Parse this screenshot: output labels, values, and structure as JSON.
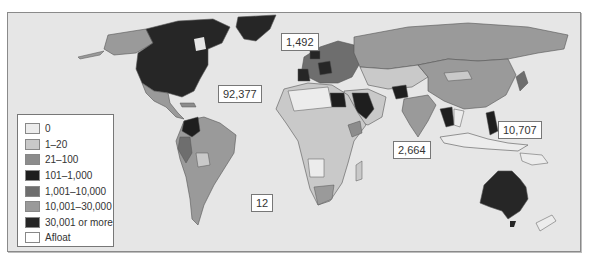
{
  "map": {
    "type": "choropleth-world",
    "background_color": "#e6e6e6",
    "callouts": [
      {
        "label": "1,492",
        "region": "greenland-north-atlantic"
      },
      {
        "label": "92,377",
        "region": "north-america"
      },
      {
        "label": "2,664",
        "region": "indian-ocean"
      },
      {
        "label": "10,707",
        "region": "philippines-pacific"
      },
      {
        "label": "12",
        "region": "south-atlantic"
      }
    ]
  },
  "legend": {
    "items": [
      {
        "label": "0",
        "color": "#ececec"
      },
      {
        "label": "1–20",
        "color": "#c9c9c9"
      },
      {
        "label": "21–100",
        "color": "#8c8c8c"
      },
      {
        "label": "101–1,000",
        "color": "#1e1e1e"
      },
      {
        "label": "1,001–10,000",
        "color": "#6e6e6e"
      },
      {
        "label": "10,001–30,000",
        "color": "#9a9a9a"
      },
      {
        "label": "30,001 or more",
        "color": "#262626"
      },
      {
        "label": "Afloat",
        "color": "#ffffff"
      }
    ]
  },
  "regions": {
    "north_america_usa_canada": "30,001 or more",
    "alaska": "10,001–30,000",
    "greenland": "30,001 or more",
    "mexico_central_america": "10,001–30,000",
    "colombia": "101–1,000",
    "brazil_argentina": "10,001–30,000",
    "andes": "1,001–10,000",
    "russia": "10,001–30,000",
    "china": "10,001–30,000",
    "india": "10,001–30,000",
    "afghanistan": "101–1,000",
    "saudi_arabia_iraq": "101–1,000",
    "egypt": "101–1,000",
    "africa_mostly": "1–20",
    "south_africa": "10,001–30,000",
    "australia": "30,001 or more",
    "philippines": "101–1,000",
    "thailand": "101–1,000",
    "europe_mixed": "1,001–10,000"
  }
}
